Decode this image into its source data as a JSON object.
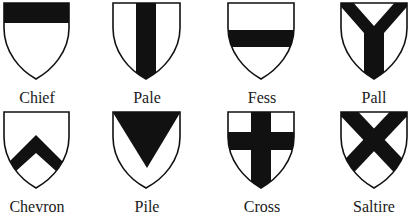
{
  "colors": {
    "fill": "#111111",
    "field": "#ffffff",
    "outline": "#111111"
  },
  "shields": [
    {
      "name": "Chief",
      "charge": "chief"
    },
    {
      "name": "Pale",
      "charge": "pale"
    },
    {
      "name": "Fess",
      "charge": "fess"
    },
    {
      "name": "Pall",
      "charge": "pall"
    },
    {
      "name": "Chevron",
      "charge": "chevron"
    },
    {
      "name": "Pile",
      "charge": "pile"
    },
    {
      "name": "Cross",
      "charge": "cross"
    },
    {
      "name": "Saltire",
      "charge": "saltire"
    }
  ]
}
